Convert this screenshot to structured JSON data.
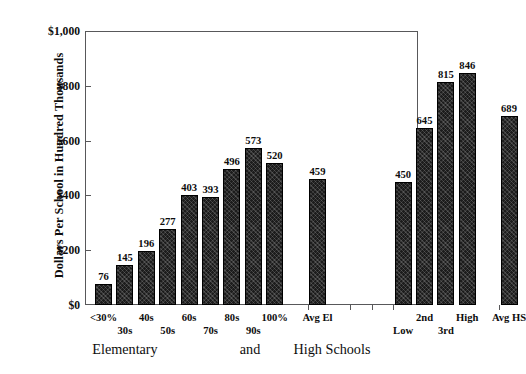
{
  "chart_data": {
    "type": "bar",
    "title": "",
    "xlabel": "",
    "ylabel": "Dollars Per School in Hundred Thousands",
    "ylim": [
      0,
      1000
    ],
    "grid": false,
    "legend": null,
    "categories": [
      "<30%",
      "30s",
      "40s",
      "50s",
      "60s",
      "70s",
      "80s",
      "90s",
      "100%",
      "Avg El",
      "Low",
      "2nd",
      "3rd",
      "High",
      "Avg HS"
    ],
    "values": [
      76,
      145,
      196,
      277,
      403,
      393,
      496,
      573,
      520,
      459,
      450,
      645,
      815,
      846,
      689
    ],
    "groups": [
      {
        "name": "Elementary",
        "categories": [
          "<30%",
          "30s",
          "40s",
          "50s",
          "60s",
          "70s",
          "80s",
          "90s",
          "100%"
        ]
      },
      {
        "name": "and",
        "categories": [
          "Avg El"
        ]
      },
      {
        "name": "High Schools",
        "categories": [
          "Low",
          "2nd",
          "3rd",
          "High",
          "Avg HS"
        ]
      }
    ],
    "y_ticks": [
      {
        "value": 1000,
        "label": "$1,000"
      },
      {
        "value": 800,
        "label": "$800"
      },
      {
        "value": 600,
        "label": "$600"
      },
      {
        "value": 400,
        "label": "$400"
      },
      {
        "value": 200,
        "label": "$200"
      },
      {
        "value": 0,
        "label": "$0"
      }
    ],
    "bar_color": "#1c1c1c"
  },
  "axis": {
    "y_title": "Dollars Per School in Hundred Thousands"
  },
  "group_labels": {
    "elementary": "Elementary",
    "and": "and",
    "high_schools": "High Schools"
  }
}
